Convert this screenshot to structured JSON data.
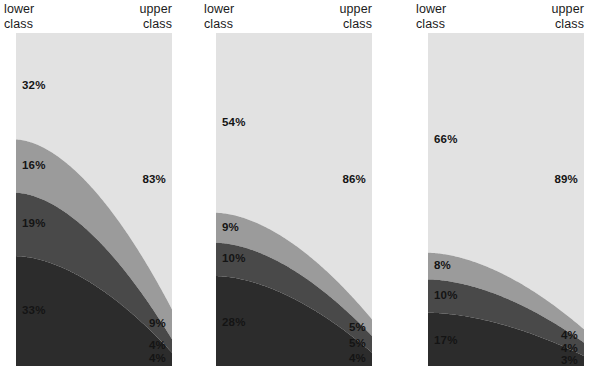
{
  "chart_data": {
    "type": "area",
    "title": "",
    "subtitle": "",
    "xlabel": "",
    "ylabel": "",
    "ylim": [
      0,
      100
    ],
    "grid": false,
    "legend_position": "none",
    "x_axis_endpoints": [
      "lower class",
      "upper class"
    ],
    "stack_order_top_to_bottom": [
      "band-1",
      "band-2",
      "band-3",
      "band-4"
    ],
    "band_colors": [
      "#e2e2e2",
      "#9b9b9b",
      "#494949",
      "#2c2c2c"
    ],
    "panels": [
      {
        "id": "panel-1",
        "left_label_line1": "lower",
        "left_label_line2": "class",
        "right_label_line1": "upper",
        "right_label_line2": "class",
        "series": [
          {
            "name": "band-1",
            "color": "#e2e2e2",
            "lower": 32,
            "upper": 83
          },
          {
            "name": "band-2",
            "color": "#9b9b9b",
            "lower": 16,
            "upper": 9
          },
          {
            "name": "band-3",
            "color": "#494949",
            "lower": 19,
            "upper": 4
          },
          {
            "name": "band-4",
            "color": "#2c2c2c",
            "lower": 33,
            "upper": 4
          }
        ],
        "labels_left": [
          "32%",
          "16%",
          "19%",
          "33%"
        ],
        "labels_right": [
          "83%",
          "9%",
          "4%",
          "4%"
        ]
      },
      {
        "id": "panel-2",
        "left_label_line1": "lower",
        "left_label_line2": "class",
        "right_label_line1": "upper",
        "right_label_line2": "class",
        "series": [
          {
            "name": "band-1",
            "color": "#e2e2e2",
            "lower": 54,
            "upper": 86
          },
          {
            "name": "band-2",
            "color": "#9b9b9b",
            "lower": 9,
            "upper": 5
          },
          {
            "name": "band-3",
            "color": "#494949",
            "lower": 10,
            "upper": 5
          },
          {
            "name": "band-4",
            "color": "#2c2c2c",
            "lower": 28,
            "upper": 4
          }
        ],
        "labels_left": [
          "54%",
          "9%",
          "10%",
          "28%"
        ],
        "labels_right": [
          "86%",
          "5%",
          "5%",
          "4%"
        ]
      },
      {
        "id": "panel-3",
        "left_label_line1": "lower",
        "left_label_line2": "class",
        "right_label_line1": "upper",
        "right_label_line2": "class",
        "series": [
          {
            "name": "band-1",
            "color": "#e2e2e2",
            "lower": 66,
            "upper": 89
          },
          {
            "name": "band-2",
            "color": "#9b9b9b",
            "lower": 8,
            "upper": 4
          },
          {
            "name": "band-3",
            "color": "#494949",
            "lower": 10,
            "upper": 4
          },
          {
            "name": "band-4",
            "color": "#2c2c2c",
            "lower": 17,
            "upper": 3
          }
        ],
        "labels_left": [
          "66%",
          "8%",
          "10%",
          "17%"
        ],
        "labels_right": [
          "89%",
          "4%",
          "4%",
          "3%"
        ]
      }
    ]
  },
  "panel_geometry": [
    {
      "x": 16,
      "width": 156
    },
    {
      "x": 216,
      "width": 156
    },
    {
      "x": 428,
      "width": 156
    }
  ],
  "panel_label_geometry": [
    {
      "left_x": 4,
      "right_x": 172
    },
    {
      "left_x": 204,
      "right_x": 372
    },
    {
      "left_x": 416,
      "right_x": 584
    }
  ],
  "plot_top": 33,
  "plot_bottom": 366
}
